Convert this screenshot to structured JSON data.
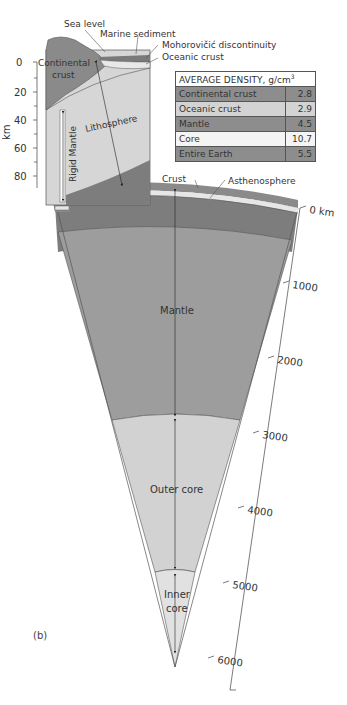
{
  "labels": {
    "sea_level": "Sea level",
    "marine_sediment": "Marine sediment",
    "moho": "Mohorovičić discontinuity",
    "oceanic_crust": "Oceanic crust",
    "continental_crust_line1": "Continental",
    "continental_crust_line2": "crust",
    "lithosphere": "Lithosphere",
    "rigid_mantle": "Rigid Mantle",
    "crust": "Crust",
    "asthenosphere": "Asthenosphere",
    "mantle": "Mantle",
    "outer_core": "Outer core",
    "inner_core_line1": "Inner",
    "inner_core_line2": "core",
    "panel": "(b)"
  },
  "inset_axis": {
    "unit": "km",
    "ticks": [
      "0",
      "20",
      "40",
      "60",
      "80"
    ]
  },
  "depth_axis": {
    "ticks": [
      "0 km",
      "1000",
      "2000",
      "3000",
      "4000",
      "5000",
      "6000"
    ]
  },
  "density_table": {
    "header": "AVERAGE DENSITY, g/cm",
    "header_sup": "3",
    "rows": [
      {
        "name": "Continental crust",
        "value": "2.8"
      },
      {
        "name": "Oceanic crust",
        "value": "2.9"
      },
      {
        "name": "Mantle",
        "value": "4.5"
      },
      {
        "name": "Core",
        "value": "10.7"
      },
      {
        "name": "Entire Earth",
        "value": "5.5"
      }
    ]
  },
  "colors": {
    "crust_dark": "#8a8a8a",
    "mantle": "#9e9e9e",
    "asthenosphere": "#7c7c7c",
    "outer_core": "#d0d0d0",
    "inner_core": "#dedede",
    "lithosphere": "#d6d6d6"
  }
}
